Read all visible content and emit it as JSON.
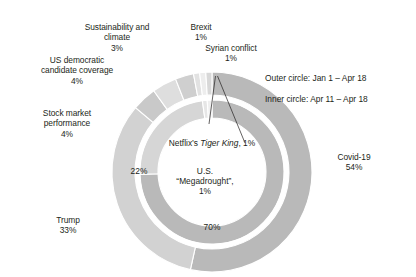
{
  "chart_data": {
    "type": "pie",
    "title": "",
    "legend_position": "callout-labels",
    "notes": [
      "Outer circle: Jan 1 – Apr 18",
      "Inner circle: Apr 11 – Apr 18"
    ],
    "rings": [
      {
        "name": "Outer circle",
        "period": "Jan 1 – Apr 18",
        "categories": [
          "Covid-19",
          "Trump",
          "Stock market performance",
          "US democratic candidate coverage",
          "Sustainability and climate",
          "Brexit",
          "Netflix's Tiger King",
          "Syrian conflict"
        ],
        "values": [
          54,
          33,
          4,
          4,
          3,
          1,
          1,
          1
        ],
        "colors": [
          "#b9b9b9",
          "#d2d2d2",
          "#c9c9c9",
          "#dedede",
          "#cfcfcf",
          "#e2e2e2",
          "#ededed",
          "#d8d8d8"
        ]
      },
      {
        "name": "Inner circle",
        "period": "Apr 11 – Apr 18",
        "categories": [
          "Covid-19",
          "Trump",
          "U.S. “Megadrought”",
          "Netflix's Tiger King"
        ],
        "values": [
          70,
          22,
          1,
          1
        ],
        "colors": [
          "#b9b9b9",
          "#d6d6d6",
          "#e6e6e6",
          "#efefef"
        ]
      }
    ]
  },
  "callouts": {
    "sustainability": {
      "name": "Sustainability and\nclimate",
      "pct": "3%"
    },
    "brexit": {
      "name": "Brexit",
      "pct": "1%"
    },
    "syrian": {
      "name": "Syrian conflict",
      "pct": "1%"
    },
    "us_democratic": {
      "name": "US democratic\ncandidate coverage",
      "pct": "4%"
    },
    "stock_market": {
      "name": "Stock market\nperformance",
      "pct": "4%"
    },
    "trump": {
      "name": "Trump",
      "pct": "33%"
    },
    "covid": {
      "name": "Covid-19",
      "pct": "54%"
    }
  },
  "notes": {
    "outer": "Outer circle: Jan 1 – Apr 18",
    "inner": "Inner circle: Apr 11 – Apr 18"
  },
  "inner_labels": {
    "netflix_prefix": "Netflix’s ",
    "netflix_italic": "Tiger King",
    "netflix_suffix": ", 1%",
    "megadrought_line1": "U.S.",
    "megadrought_line2": "“Megadrought”,",
    "megadrought_pct": "1%",
    "inner_trump_pct": "22%",
    "inner_covid_pct": "70%"
  },
  "geometry": {
    "cx": 212,
    "cy": 172,
    "outer_r_out": 100,
    "outer_r_in": 77,
    "inner_r_out": 72,
    "inner_r_in": 54
  },
  "colors": {
    "text": "#231f20",
    "background": "#ffffff",
    "divider": "#ffffff"
  }
}
